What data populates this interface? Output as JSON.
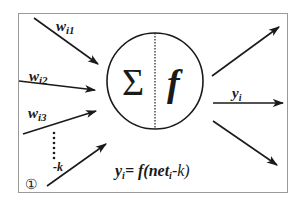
{
  "diagram": {
    "type": "neuron-model",
    "inputs": [
      {
        "label_main": "w",
        "label_sub": "i1"
      },
      {
        "label_main": "w",
        "label_sub": "i2"
      },
      {
        "label_main": "w",
        "label_sub": "i3"
      },
      {
        "label_main": "-k",
        "label_sub": ""
      }
    ],
    "threshold_input_marker": "①",
    "node": {
      "sum_symbol": "Σ",
      "activation_symbol": "f"
    },
    "output": {
      "label_main": "y",
      "label_sub": "i"
    },
    "equation": {
      "lhs_main": "y",
      "lhs_sub": "i",
      "rhs_prefix": "= f(net",
      "rhs_sub": "i",
      "rhs_suffix": "-k)"
    },
    "output_arrows": 3,
    "colors": {
      "stroke": "#1a1a1a",
      "frame": "#9a9a9a",
      "background": "#ffffff"
    }
  }
}
